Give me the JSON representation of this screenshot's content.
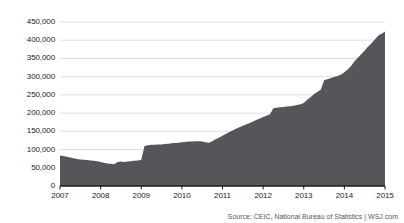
{
  "chart_data": {
    "type": "area",
    "title": "",
    "subtitle": "",
    "xlabel": "",
    "ylabel": "",
    "xlim": [
      2007,
      2015
    ],
    "ylim": [
      0,
      450000
    ],
    "grid": true,
    "legend": false,
    "series_name": "China foreign-exchange reserves",
    "fill_color": "#55555a",
    "grid_color": "#d8d8d8",
    "axis_color": "#1b1b1b",
    "y_ticks": [
      0,
      50000,
      100000,
      150000,
      200000,
      250000,
      300000,
      350000,
      400000,
      450000
    ],
    "y_tick_labels": [
      "0",
      "50,000",
      "100,000",
      "150,000",
      "200,000",
      "250,000",
      "300,000",
      "350,000",
      "400,000",
      "450,000"
    ],
    "x_ticks": [
      2007,
      2008,
      2009,
      2010,
      2011,
      2012,
      2013,
      2014,
      2015
    ],
    "x_tick_labels": [
      "2007",
      "2008",
      "2009",
      "2010",
      "2011",
      "2012",
      "2013",
      "2014",
      "2015"
    ],
    "x": [
      2007.0,
      2007.08,
      2007.17,
      2007.25,
      2007.33,
      2007.42,
      2007.5,
      2007.58,
      2007.67,
      2007.75,
      2007.83,
      2007.92,
      2008.0,
      2008.08,
      2008.17,
      2008.25,
      2008.33,
      2008.42,
      2008.5,
      2008.58,
      2008.67,
      2008.75,
      2008.83,
      2008.92,
      2009.0,
      2009.08,
      2009.17,
      2009.25,
      2009.33,
      2009.42,
      2009.5,
      2009.58,
      2009.67,
      2009.75,
      2009.83,
      2009.92,
      2010.0,
      2010.08,
      2010.17,
      2010.25,
      2010.33,
      2010.42,
      2010.5,
      2010.58,
      2010.67,
      2010.75,
      2010.83,
      2010.92,
      2011.0,
      2011.08,
      2011.17,
      2011.25,
      2011.33,
      2011.42,
      2011.5,
      2011.58,
      2011.67,
      2011.75,
      2011.83,
      2011.92,
      2012.0,
      2012.08,
      2012.17,
      2012.25,
      2012.33,
      2012.42,
      2012.5,
      2012.58,
      2012.67,
      2012.75,
      2012.83,
      2012.92,
      2013.0,
      2013.08,
      2013.17,
      2013.25,
      2013.33,
      2013.42,
      2013.5,
      2013.58,
      2013.67,
      2013.75,
      2013.83,
      2013.92,
      2014.0,
      2014.08,
      2014.17,
      2014.25,
      2014.33,
      2014.42,
      2014.5,
      2014.58,
      2014.67,
      2014.75,
      2014.83,
      2014.92,
      2015.0
    ],
    "values": [
      84000,
      82000,
      80000,
      78000,
      76000,
      74000,
      73000,
      72000,
      71000,
      70000,
      69000,
      68000,
      66000,
      64000,
      62000,
      61000,
      60000,
      66000,
      67000,
      66000,
      67000,
      68000,
      69000,
      70000,
      72000,
      110000,
      112000,
      113000,
      113000,
      114000,
      114000,
      115000,
      116000,
      117000,
      118000,
      119000,
      120000,
      121000,
      122000,
      122000,
      123000,
      123000,
      122000,
      120000,
      119000,
      123000,
      128000,
      133000,
      138000,
      143000,
      148000,
      152000,
      157000,
      161000,
      165000,
      169000,
      173000,
      177000,
      181000,
      185000,
      189000,
      193000,
      197000,
      213000,
      215000,
      216000,
      217000,
      218000,
      219000,
      220000,
      222000,
      224000,
      228000,
      236000,
      244000,
      252000,
      258000,
      264000,
      290000,
      293000,
      296000,
      299000,
      302000,
      306000,
      312000,
      320000,
      330000,
      342000,
      352000,
      362000,
      372000,
      382000,
      392000,
      402000,
      412000,
      418000,
      424000
    ]
  },
  "footer": {
    "source": "Source: CEIC, National Bureau of Statistics  |  WSJ.com"
  }
}
